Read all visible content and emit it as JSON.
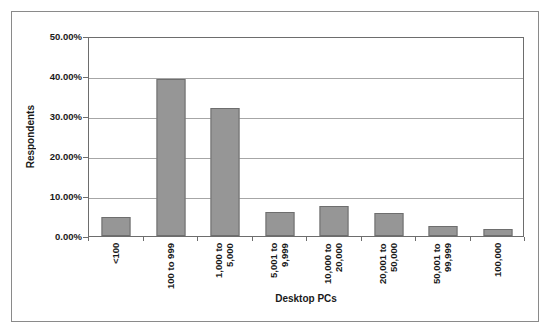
{
  "chart_data": {
    "type": "bar",
    "title": "",
    "xlabel": "Desktop PCs",
    "ylabel": "Respondents",
    "categories": [
      "<100",
      "100 to 999",
      "1,000 to 5,000",
      "5,001 to 9,999",
      "10,000 to 20,000",
      "20,001 to 50,000",
      "50,001 to 99,999",
      "100,000"
    ],
    "category_lines": [
      [
        "<100"
      ],
      [
        "100 to 999"
      ],
      [
        "1,000 to",
        "5,000"
      ],
      [
        "5,001 to",
        "9,999"
      ],
      [
        "10,000 to",
        "20,000"
      ],
      [
        "20,001 to",
        "50,000"
      ],
      [
        "50,001 to",
        "99,999"
      ],
      [
        "100,000"
      ]
    ],
    "values": [
      4.8,
      39.2,
      32.0,
      6.0,
      7.5,
      5.8,
      2.5,
      1.8
    ],
    "value_unit": "%",
    "ylim": [
      0,
      50
    ],
    "ytick_values": [
      0,
      10,
      20,
      30,
      40,
      50
    ],
    "ytick_labels": [
      "0.00%",
      "10.00%",
      "20.00%",
      "30.00%",
      "40.00%",
      "50.00%"
    ],
    "grid": true,
    "legend": "none",
    "bar_color": "#969696",
    "bar_border_color": "#6e6e6e",
    "gridline_color": "#a6a6a6",
    "axis_color": "#6d6d6d",
    "frame_color": "#8a8a8a",
    "background_color": "#ffffff"
  }
}
